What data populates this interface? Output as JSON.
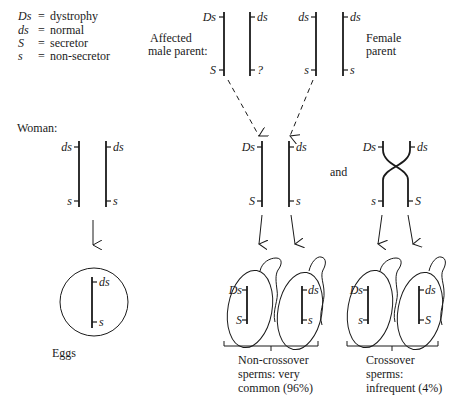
{
  "legend": {
    "items": [
      {
        "symbol": "Ds",
        "eq": "=",
        "meaning": "dystrophy"
      },
      {
        "symbol": "ds",
        "eq": "=",
        "meaning": "normal"
      },
      {
        "symbol": "S",
        "eq": "=",
        "meaning": "secretor"
      },
      {
        "symbol": "s",
        "eq": "=",
        "meaning": "non-secretor"
      }
    ]
  },
  "parents": {
    "male_label_line1": "Affected",
    "male_label_line2": "male parent:",
    "female_label_line1": "Female",
    "female_label_line2": "parent",
    "male_chrom1": {
      "top": "Ds",
      "bottom": "S"
    },
    "male_chrom2": {
      "top": "ds",
      "bottom": "?"
    },
    "female_chrom1": {
      "top": "ds",
      "bottom": "s"
    },
    "female_chrom2": {
      "top": "ds",
      "bottom": "s"
    }
  },
  "woman": {
    "label": "Woman:",
    "chrom1": {
      "top": "ds",
      "bottom": "s"
    },
    "chrom2": {
      "top": "ds",
      "bottom": "s"
    },
    "egg": {
      "top": "ds",
      "bottom": "s"
    },
    "eggs_label": "Eggs"
  },
  "man_genotype": {
    "chrom1": {
      "top": "Ds",
      "bottom": "S"
    },
    "chrom2": {
      "top": "ds",
      "bottom": "s"
    }
  },
  "and_label": "and",
  "crossover_pair": {
    "top_left": "Ds",
    "top_right": "ds",
    "bottom_left": "s",
    "bottom_right": "S"
  },
  "sperms": {
    "noncrossover": [
      {
        "top": "Ds",
        "bottom": "S"
      },
      {
        "top": "ds",
        "bottom": "s"
      }
    ],
    "crossover": [
      {
        "top": "Ds",
        "bottom": "s"
      },
      {
        "top": "ds",
        "bottom": "S"
      }
    ],
    "noncrossover_caption": [
      "Non-crossover",
      "sperms: very",
      "common (96%)"
    ],
    "crossover_caption": [
      "Crossover",
      "sperms:",
      "infrequent (4%)"
    ]
  }
}
